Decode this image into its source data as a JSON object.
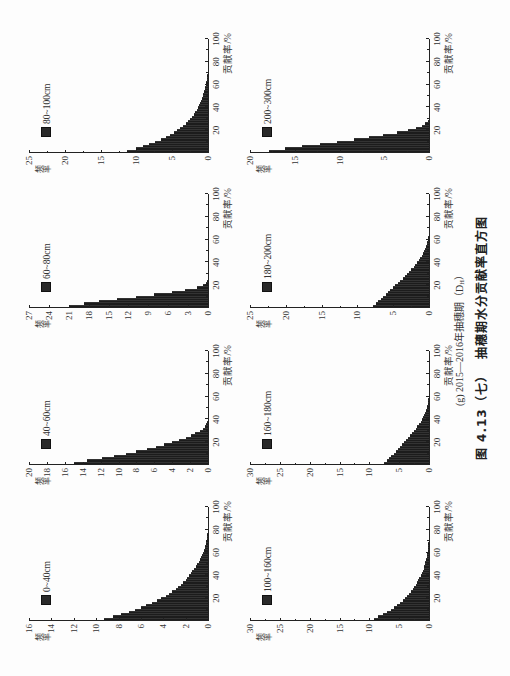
{
  "page": {
    "subcaption_prefix": "(g) 2015—2016年抽穗期（D",
    "subcaption_subscript": "H",
    "subcaption_suffix": "）",
    "caption": "图 4.13（七）  抽穗期水分贡献率直方图"
  },
  "chart_data": [
    {
      "type": "bar",
      "title": "0~40cm",
      "legend": "0~40cm",
      "xlabel": "贡献率/%",
      "ylabel": "频率",
      "xlim": [
        0,
        100
      ],
      "xticks": [
        20,
        40,
        60,
        80,
        100
      ],
      "ylim": [
        0,
        16
      ],
      "yticks": [
        0,
        2,
        4,
        6,
        8,
        10,
        12,
        14,
        16
      ],
      "bin_width": 2,
      "grid": false,
      "legend_position": "upper-left",
      "values": [
        9.3,
        8.5,
        7.8,
        7.1,
        6.5,
        6.0,
        5.5,
        5.0,
        4.6,
        4.2,
        3.8,
        3.5,
        3.2,
        2.9,
        2.7,
        2.4,
        2.2,
        2.0,
        1.9,
        1.7,
        1.5,
        1.4,
        1.25,
        1.1,
        1.0,
        0.85,
        0.75,
        0.65,
        0.55,
        0.45,
        0.38,
        0.3,
        0.25,
        0.2,
        0.15,
        0.1,
        0.08,
        0.05,
        0.03
      ]
    },
    {
      "type": "bar",
      "title": "40~60cm",
      "legend": "40~60cm",
      "xlabel": "贡献率/%",
      "ylabel": "频率",
      "xlim": [
        0,
        100
      ],
      "xticks": [
        20,
        40,
        60,
        80,
        100
      ],
      "ylim": [
        0,
        20
      ],
      "yticks": [
        0,
        2,
        4,
        6,
        8,
        10,
        12,
        14,
        16,
        18,
        20
      ],
      "bin_width": 2,
      "grid": false,
      "legend_position": "upper-left",
      "values": [
        15.0,
        13.5,
        11.9,
        10.5,
        9.2,
        8.0,
        6.8,
        5.8,
        4.9,
        4.0,
        3.2,
        2.5,
        1.9,
        1.4,
        0.9,
        0.6,
        0.3,
        0.2,
        0.1,
        0.05
      ]
    },
    {
      "type": "bar",
      "title": "60~80cm",
      "legend": "60~80cm",
      "xlabel": "贡献率/%",
      "ylabel": "频率",
      "xlim": [
        0,
        100
      ],
      "xticks": [
        20,
        40,
        60,
        80,
        100
      ],
      "ylim": [
        0,
        27
      ],
      "yticks": [
        0,
        3,
        6,
        9,
        12,
        15,
        18,
        21,
        24,
        27
      ],
      "bin_width": 2,
      "grid": false,
      "legend_position": "upper-left",
      "values": [
        21.0,
        18.7,
        16.4,
        13.7,
        10.8,
        8.2,
        5.5,
        3.4,
        1.7,
        0.8,
        0.3,
        0.1
      ]
    },
    {
      "type": "bar",
      "title": "80~100cm",
      "legend": "80~100cm",
      "xlabel": "贡献率/%",
      "ylabel": "频率",
      "xlim": [
        0,
        100
      ],
      "xticks": [
        20,
        40,
        60,
        80,
        100
      ],
      "ylim": [
        0,
        25
      ],
      "yticks": [
        0,
        5,
        10,
        15,
        20,
        25
      ],
      "bin_width": 2,
      "grid": false,
      "legend_position": "upper-left",
      "values": [
        11.3,
        10.1,
        9.1,
        8.2,
        7.4,
        6.6,
        5.9,
        5.3,
        4.8,
        4.3,
        3.9,
        3.5,
        3.1,
        2.8,
        2.5,
        2.2,
        2.0,
        1.8,
        1.6,
        1.4,
        1.25,
        1.1,
        0.95,
        0.85,
        0.75,
        0.65,
        0.55,
        0.45,
        0.4,
        0.3,
        0.25,
        0.2,
        0.15,
        0.1,
        0.07,
        0.04
      ]
    },
    {
      "type": "bar",
      "title": "100~160cm",
      "legend": "100~160cm",
      "xlabel": "贡献率/%",
      "ylabel": "频率",
      "xlim": [
        0,
        100
      ],
      "xticks": [
        20,
        40,
        60,
        80,
        100
      ],
      "ylim": [
        0,
        30
      ],
      "yticks": [
        0,
        5,
        10,
        15,
        20,
        25,
        30
      ],
      "bin_width": 2,
      "grid": false,
      "legend_position": "upper-left",
      "values": [
        9.3,
        8.5,
        7.7,
        7.0,
        6.4,
        5.8,
        5.3,
        4.8,
        4.4,
        4.0,
        3.65,
        3.3,
        3.0,
        2.7,
        2.45,
        2.2,
        2.0,
        1.8,
        1.6,
        1.4,
        1.2,
        1.05,
        0.9,
        0.8,
        0.7,
        0.6,
        0.5,
        0.4,
        0.35,
        0.3,
        0.25,
        0.2,
        0.15,
        0.1,
        0.05
      ]
    },
    {
      "type": "bar",
      "title": "160~180cm",
      "legend": "160~180cm",
      "xlabel": "贡献率/%",
      "ylabel": "频率",
      "xlim": [
        0,
        100
      ],
      "xticks": [
        20,
        40,
        60,
        80,
        100
      ],
      "ylim": [
        0,
        30
      ],
      "yticks": [
        0,
        5,
        10,
        15,
        20,
        25,
        30
      ],
      "bin_width": 2,
      "grid": false,
      "legend_position": "upper-left",
      "values": [
        7.5,
        7.1,
        6.7,
        6.3,
        5.95,
        5.6,
        5.25,
        4.9,
        4.55,
        4.2,
        3.85,
        3.5,
        3.15,
        2.85,
        2.55,
        2.25,
        1.95,
        1.65,
        1.4,
        1.15,
        0.95,
        0.8,
        0.65,
        0.5,
        0.4,
        0.3,
        0.2,
        0.15,
        0.1,
        0.05
      ]
    },
    {
      "type": "bar",
      "title": "180~200cm",
      "legend": "180~200cm",
      "xlabel": "贡献率/%",
      "ylabel": "频率",
      "xlim": [
        0,
        100
      ],
      "xticks": [
        20,
        40,
        60,
        80,
        100
      ],
      "ylim": [
        0,
        25
      ],
      "yticks": [
        0,
        5,
        10,
        15,
        20,
        25
      ],
      "bin_width": 2,
      "grid": false,
      "legend_position": "upper-left",
      "values": [
        7.8,
        7.45,
        7.1,
        6.75,
        6.4,
        6.05,
        5.7,
        5.4,
        5.05,
        4.7,
        4.4,
        4.05,
        3.7,
        3.4,
        3.05,
        2.75,
        2.45,
        2.15,
        1.9,
        1.65,
        1.4,
        1.2,
        1.0,
        0.85,
        0.7,
        0.55,
        0.45,
        0.35,
        0.25,
        0.15,
        0.1,
        0.05
      ]
    },
    {
      "type": "bar",
      "title": "200~300cm",
      "legend": "200~300cm",
      "xlabel": "贡献率/%",
      "ylabel": "频率",
      "xlim": [
        0,
        100
      ],
      "xticks": [
        20,
        40,
        60,
        80,
        100
      ],
      "ylim": [
        0,
        20
      ],
      "yticks": [
        0,
        5,
        10,
        15,
        20
      ],
      "bin_width": 2,
      "grid": false,
      "legend_position": "upper-left",
      "values": [
        17.9,
        16.1,
        14.2,
        12.2,
        10.3,
        8.4,
        6.7,
        5.1,
        3.6,
        2.4,
        1.5,
        0.75,
        0.4,
        0.1
      ]
    }
  ]
}
